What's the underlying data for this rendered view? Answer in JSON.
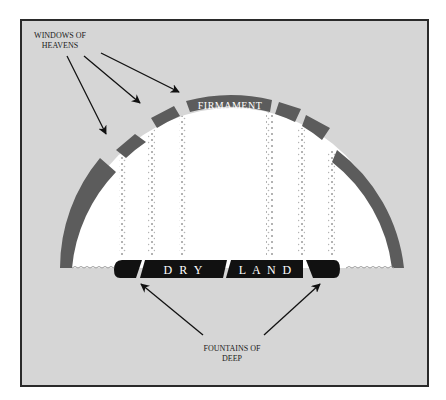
{
  "diagram": {
    "labels": {
      "windows_line1": "WINDOWS OF",
      "windows_line2": "HEAVENS",
      "firmament": "FIRMAMENT",
      "dry": "D R Y",
      "land": "L A N D",
      "fountains_line1": "FOUNTAINS OF",
      "fountains_line2": "DEEP"
    },
    "colors": {
      "background": "#d6d6d6",
      "frame": "#2a2a2a",
      "firmament": "#5c5c5c",
      "dome_interior": "#ffffff",
      "land": "#111111",
      "rain": "#9a9a9a",
      "text": "#1a1a1a"
    },
    "elements": [
      {
        "name": "windows-of-heavens-label",
        "arrows": 3
      },
      {
        "name": "firmament-dome",
        "segments": 7
      },
      {
        "name": "rain-columns",
        "count": 6
      },
      {
        "name": "dry-land",
        "sections": 4
      },
      {
        "name": "fountains-of-deep-label",
        "arrows": 2
      }
    ]
  }
}
